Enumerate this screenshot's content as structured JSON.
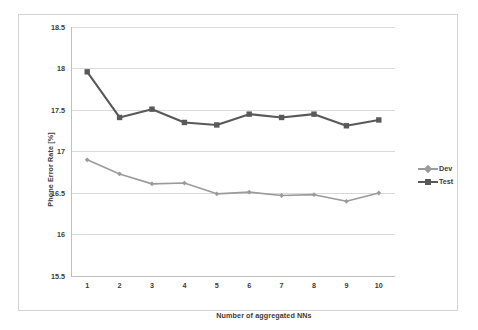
{
  "chart_data": {
    "type": "line",
    "title": "",
    "xlabel": "Number of aggregated NNs",
    "ylabel": "Phone Error Rate [%]",
    "x": [
      1,
      2,
      3,
      4,
      5,
      6,
      7,
      8,
      9,
      10
    ],
    "xticklabels": [
      "1",
      "2",
      "3",
      "4",
      "5",
      "6",
      "7",
      "8",
      "9",
      "10"
    ],
    "yticklabels": [
      "18.5",
      "18",
      "17.5",
      "17",
      "16.5",
      "16",
      "15.5"
    ],
    "yticks": [
      18.5,
      18,
      17.5,
      17,
      16.5,
      16,
      15.5
    ],
    "xlim": [
      0.5,
      10.5
    ],
    "ylim": [
      15.5,
      18.5
    ],
    "grid": "horizontal",
    "legend_position": "right",
    "series": [
      {
        "name": "Dev",
        "color": "#9b9b9b",
        "marker": "diamond",
        "values": [
          16.9,
          16.73,
          16.61,
          16.62,
          16.49,
          16.51,
          16.47,
          16.48,
          16.4,
          16.5
        ]
      },
      {
        "name": "Test",
        "color": "#595959",
        "marker": "square",
        "values": [
          17.96,
          17.41,
          17.51,
          17.35,
          17.32,
          17.45,
          17.41,
          17.45,
          17.31,
          17.38
        ]
      }
    ]
  },
  "style": {
    "gridline_color": "#d9d9d9",
    "axis_color": "#bfbfbf",
    "text_color": "#3a3a3a",
    "background": "#ffffff",
    "border_color": "#d4d4d4"
  }
}
